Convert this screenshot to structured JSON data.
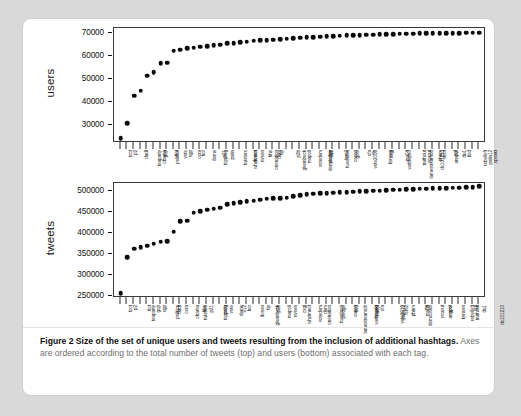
{
  "figure": {
    "caption_lead": "Figure 2  Size of the set of unique users and tweets resulting from the inclusion of additional hashtags.",
    "caption_rest": " Axes are ordered according to the total number of tweets (top) and users (bottom) associated with each tag."
  },
  "chart_data": [
    {
      "type": "scatter",
      "id": "users-plot",
      "title": "",
      "ylabel": "users",
      "xlabel": "",
      "ytick_labels": [
        "30000",
        "40000",
        "50000",
        "60000",
        "70000"
      ],
      "ytick_values": [
        30000,
        40000,
        50000,
        60000,
        70000
      ],
      "ylim": [
        22000,
        72000
      ],
      "grid": false,
      "legend": false,
      "categories": [
        "tcot",
        "p2",
        "dadt",
        "teaparty",
        "obama",
        "gop",
        "politics",
        "tlot",
        "vote",
        "sgp",
        "ocra",
        "hcr",
        "dems",
        "topprog",
        "p21",
        "palin",
        "twisters",
        "whyimnot",
        "dosen",
        "nvsen",
        "onenation",
        "hhs",
        "dem",
        "tlp",
        "glennbeck",
        "p2b",
        "mapoli",
        "votedem",
        "democrats",
        "pledge",
        "912",
        "tweetcon",
        "fem2",
        "casen",
        "gotv",
        "vote2010",
        "ofa",
        "ffs",
        "kynsen",
        "csgj",
        "wethepeo",
        "ma04",
        "lamestreamob",
        "truthout",
        "youcut",
        "dc101210",
        "phnm",
        "ucot",
        "annpol",
        "sgf",
        "du1",
        "tlod",
        "rebelleft",
        "palin12",
        "speakt"
      ],
      "values": [
        24000,
        30600,
        42500,
        44700,
        51300,
        52700,
        56800,
        57000,
        62200,
        62600,
        63100,
        63400,
        63900,
        64100,
        64400,
        64700,
        65300,
        65500,
        65900,
        66100,
        66400,
        66600,
        66800,
        67000,
        67200,
        67400,
        67600,
        67800,
        67950,
        68100,
        68250,
        68400,
        68550,
        68650,
        68750,
        68850,
        68950,
        69050,
        69150,
        69250,
        69320,
        69380,
        69440,
        69500,
        69560,
        69610,
        69660,
        69700,
        69740,
        69780,
        69810,
        69840,
        69870,
        69900,
        69930
      ],
      "marker": "filled-circle",
      "marker_color": "#0b0b0b"
    },
    {
      "type": "scatter",
      "id": "tweets-plot",
      "title": "",
      "ylabel": "tweets",
      "xlabel": "",
      "ytick_labels": [
        "250000",
        "300000",
        "350000",
        "400000",
        "450000",
        "500000"
      ],
      "ytick_values": [
        250000,
        300000,
        350000,
        400000,
        450000,
        500000
      ],
      "ylim": [
        245000,
        520000
      ],
      "grid": false,
      "legend": false,
      "categories": [
        "tcot",
        "p2",
        "teaparty",
        "tlot",
        "gop",
        "sgp",
        "politics",
        "dadt",
        "ocra",
        "obama",
        "twisters",
        "hhs",
        "p21",
        "topprog",
        "palin",
        "vote",
        "dems",
        "912",
        "hcr",
        "dosen",
        "glennbeck",
        "tlp",
        "p2b",
        "mapoli",
        "nvsen",
        "whyimnot",
        "csgj",
        "votedem",
        "onenation",
        "dem",
        "tweetcon",
        "pledge",
        "lamestreamob",
        "casen",
        "tlod",
        "wethepeo",
        "speakt",
        "ucot",
        "ofa",
        "vote2010",
        "palin12",
        "fem2",
        "phnm",
        "democrats",
        "ma04",
        "ffs",
        "youcut",
        "annpol",
        "gotv",
        "kynsen",
        "rebelleft",
        "truthout",
        "sgf",
        "du1",
        "dc101210"
      ],
      "values": [
        257000,
        342000,
        363000,
        366000,
        370000,
        375000,
        380000,
        381000,
        404000,
        428000,
        430000,
        449000,
        452000,
        456000,
        459000,
        461000,
        469000,
        472000,
        474000,
        476000,
        478000,
        480000,
        482000,
        483000,
        484000,
        485000,
        489000,
        491000,
        493000,
        494000,
        495000,
        496000,
        497000,
        497500,
        498500,
        499500,
        500500,
        501000,
        501500,
        502000,
        503000,
        503500,
        504000,
        505000,
        505500,
        506000,
        506500,
        507000,
        507500,
        508000,
        508500,
        509000,
        509500,
        510500,
        512000
      ],
      "marker": "filled-circle",
      "marker_color": "#0b0b0b"
    }
  ]
}
